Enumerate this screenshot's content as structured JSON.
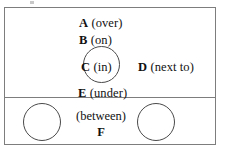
{
  "figure": {
    "type": "spatial-preposition-diagram",
    "panels": [
      {
        "id": "upper",
        "name": "vertical-relations-panel",
        "shapes": [
          {
            "name": "reference-circle",
            "role": "container-for-in"
          }
        ],
        "labels": [
          {
            "tag": "A",
            "prep": "(over)"
          },
          {
            "tag": "B",
            "prep": "(on)"
          },
          {
            "tag": "C",
            "prep": "(in)"
          },
          {
            "tag": "D",
            "prep": "(next to)"
          },
          {
            "tag": "E",
            "prep": "(under)"
          }
        ]
      },
      {
        "id": "lower",
        "name": "between-relation-panel",
        "shapes": [
          {
            "name": "left-circle",
            "role": "left-reference-object"
          },
          {
            "name": "right-circle",
            "role": "right-reference-object"
          }
        ],
        "labels": [
          {
            "tag": "F",
            "prep": "(between)"
          }
        ]
      }
    ],
    "colors": {
      "background": "#ffffff",
      "frame_border": "#7d7d7d",
      "circle_stroke": "#4a4a4a",
      "text": "#111111"
    }
  }
}
